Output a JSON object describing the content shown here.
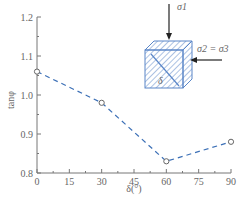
{
  "chart_data": {
    "type": "line",
    "title": "",
    "xlabel": "δ(°)",
    "ylabel": "tanφ",
    "x": [
      0,
      30,
      60,
      90
    ],
    "series": [
      {
        "name": "tanφ",
        "values": [
          1.06,
          0.98,
          0.83,
          0.88
        ],
        "marker": "open-circle",
        "line": "dashed"
      }
    ],
    "xlim": [
      0,
      90
    ],
    "ylim": [
      0.8,
      1.2
    ],
    "xticks": [
      0,
      15,
      30,
      45,
      60,
      75,
      90
    ],
    "yticks": [
      0.8,
      0.9,
      1.0,
      1.1,
      1.2
    ],
    "xtick_labels": [
      "0",
      "15",
      "30",
      "45",
      "60",
      "75",
      "90"
    ],
    "ytick_labels": [
      "0.8",
      "0.9",
      "1.0",
      "1.1",
      "1.2"
    ],
    "grid": false,
    "legend": null,
    "annotations": {
      "inset": "hatched cube under loading",
      "sigma1_label": "σ1",
      "sigma23_label": "σ2 = σ3",
      "delta_label": "δ"
    },
    "colors": {
      "line": "#3b6fb6",
      "marker": "#666666",
      "axis": "#777777",
      "cube_edge": "#5a86c8",
      "delta_text": "#c0392b"
    }
  }
}
